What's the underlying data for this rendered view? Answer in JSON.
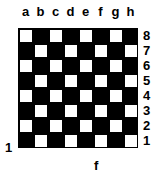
{
  "board": {
    "files": [
      "a",
      "b",
      "c",
      "d",
      "e",
      "f",
      "g",
      "h"
    ],
    "ranks": [
      "8",
      "7",
      "6",
      "5",
      "4",
      "3",
      "2",
      "1"
    ],
    "top_left_square_color": "light",
    "light_color": "#ffffff",
    "dark_color": "#000000"
  },
  "annotations": {
    "left_label": "1",
    "bottom_label": "f"
  }
}
